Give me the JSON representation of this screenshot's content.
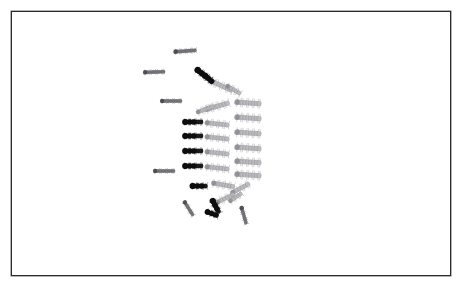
{
  "figure": {
    "background_color": "#ffffff",
    "frame": {
      "color": "#2a2a2e",
      "x": 11,
      "y": 11,
      "width": 440,
      "height": 265,
      "border_width": 1
    }
  },
  "palette": {
    "dark_body": "#1a1a1a",
    "dark_head": "#0d0d0d",
    "mid_body": "#6e6e72",
    "light_body": "#b8b8bc",
    "light_outline": "#8c8c92",
    "hair": "#a6a6ab",
    "background": "#ffffff"
  },
  "legend": {
    "dark_label": "dark-segmented larva",
    "mid_label": "grey larva",
    "light_label": "pale bristled larva"
  },
  "counts": {
    "dark_specimens": 9,
    "mid_specimens": 6,
    "light_specimens": 18,
    "total_specimens": 33
  },
  "specimens": [
    {
      "id": 1,
      "type": "mid",
      "x": 186,
      "y": 51,
      "len": 20,
      "thick": 4.4,
      "angle": -4,
      "tone": "mid"
    },
    {
      "id": 2,
      "type": "mid",
      "x": 155,
      "y": 72,
      "len": 19,
      "thick": 4.2,
      "angle": -2,
      "tone": "mid"
    },
    {
      "id": 3,
      "type": "mid",
      "x": 172,
      "y": 101,
      "len": 19,
      "thick": 4.2,
      "angle": 0,
      "tone": "mid"
    },
    {
      "id": 4,
      "type": "mid",
      "x": 165,
      "y": 171,
      "len": 19,
      "thick": 4.2,
      "angle": 0,
      "tone": "mid"
    },
    {
      "id": 5,
      "type": "mid",
      "x": 189,
      "y": 209,
      "len": 15,
      "thick": 4.0,
      "angle": 58,
      "tone": "mid"
    },
    {
      "id": 6,
      "type": "mid",
      "x": 244,
      "y": 216,
      "len": 16,
      "thick": 4.2,
      "angle": 74,
      "tone": "mid"
    },
    {
      "id": 7,
      "type": "dark",
      "x": 204,
      "y": 75,
      "len": 15,
      "thick": 6.0,
      "angle": 38,
      "tone": "dark"
    },
    {
      "id": 8,
      "type": "light",
      "x": 222,
      "y": 86,
      "len": 22,
      "thick": 5.0,
      "angle": 24,
      "tone": "light"
    },
    {
      "id": 9,
      "type": "light",
      "x": 218,
      "y": 106,
      "len": 22,
      "thick": 5.0,
      "angle": -16,
      "tone": "light"
    },
    {
      "id": 10,
      "type": "dark",
      "x": 194,
      "y": 122,
      "len": 17,
      "thick": 5.4,
      "angle": 0,
      "tone": "dark"
    },
    {
      "id": 11,
      "type": "light",
      "x": 218,
      "y": 124,
      "len": 21,
      "thick": 4.8,
      "angle": 6,
      "tone": "light"
    },
    {
      "id": 12,
      "type": "dark",
      "x": 194,
      "y": 136,
      "len": 17,
      "thick": 5.4,
      "angle": 0,
      "tone": "dark"
    },
    {
      "id": 13,
      "type": "light",
      "x": 218,
      "y": 138,
      "len": 21,
      "thick": 4.8,
      "angle": 6,
      "tone": "light"
    },
    {
      "id": 14,
      "type": "dark",
      "x": 194,
      "y": 151,
      "len": 17,
      "thick": 5.4,
      "angle": 0,
      "tone": "dark"
    },
    {
      "id": 15,
      "type": "light",
      "x": 218,
      "y": 153,
      "len": 21,
      "thick": 4.8,
      "angle": 6,
      "tone": "light"
    },
    {
      "id": 16,
      "type": "dark",
      "x": 194,
      "y": 166,
      "len": 17,
      "thick": 5.4,
      "angle": 0,
      "tone": "dark"
    },
    {
      "id": 17,
      "type": "light",
      "x": 218,
      "y": 168,
      "len": 21,
      "thick": 4.8,
      "angle": 6,
      "tone": "light"
    },
    {
      "id": 18,
      "type": "dark",
      "x": 200,
      "y": 186,
      "len": 14,
      "thick": 5.6,
      "angle": 0,
      "tone": "dark"
    },
    {
      "id": 19,
      "type": "light",
      "x": 224,
      "y": 185,
      "len": 20,
      "thick": 4.8,
      "angle": 10,
      "tone": "light"
    },
    {
      "id": 20,
      "type": "light",
      "x": 249,
      "y": 103,
      "len": 23,
      "thick": 5.2,
      "angle": 4,
      "tone": "light"
    },
    {
      "id": 21,
      "type": "light",
      "x": 249,
      "y": 118,
      "len": 23,
      "thick": 5.2,
      "angle": 4,
      "tone": "light"
    },
    {
      "id": 22,
      "type": "light",
      "x": 249,
      "y": 133,
      "len": 23,
      "thick": 5.2,
      "angle": 4,
      "tone": "light"
    },
    {
      "id": 23,
      "type": "light",
      "x": 249,
      "y": 148,
      "len": 23,
      "thick": 5.2,
      "angle": 4,
      "tone": "light"
    },
    {
      "id": 24,
      "type": "light",
      "x": 249,
      "y": 162,
      "len": 23,
      "thick": 5.2,
      "angle": 4,
      "tone": "light"
    },
    {
      "id": 25,
      "type": "light",
      "x": 249,
      "y": 175,
      "len": 23,
      "thick": 5.2,
      "angle": 4,
      "tone": "light"
    },
    {
      "id": 26,
      "type": "light",
      "x": 241,
      "y": 188,
      "len": 18,
      "thick": 4.6,
      "angle": -28,
      "tone": "light"
    },
    {
      "id": 27,
      "type": "light",
      "x": 226,
      "y": 198,
      "len": 18,
      "thick": 4.6,
      "angle": -26,
      "tone": "light"
    },
    {
      "id": 28,
      "type": "dark",
      "x": 216,
      "y": 207,
      "len": 13,
      "thick": 5.6,
      "angle": 62,
      "tone": "dark"
    },
    {
      "id": 29,
      "type": "dark",
      "x": 213,
      "y": 214,
      "len": 11,
      "thick": 5.2,
      "angle": 20,
      "tone": "dark"
    },
    {
      "id": 30,
      "type": "light",
      "x": 234,
      "y": 90,
      "len": 14,
      "thick": 4.4,
      "angle": 30,
      "tone": "light"
    },
    {
      "id": 31,
      "type": "light",
      "x": 206,
      "y": 109,
      "len": 16,
      "thick": 4.4,
      "angle": -20,
      "tone": "light"
    },
    {
      "id": 32,
      "type": "dark",
      "x": 209,
      "y": 79,
      "len": 10,
      "thick": 5.4,
      "angle": 40,
      "tone": "dark"
    },
    {
      "id": 33,
      "type": "light",
      "x": 236,
      "y": 197,
      "len": 13,
      "thick": 4.2,
      "angle": -34,
      "tone": "light"
    }
  ]
}
